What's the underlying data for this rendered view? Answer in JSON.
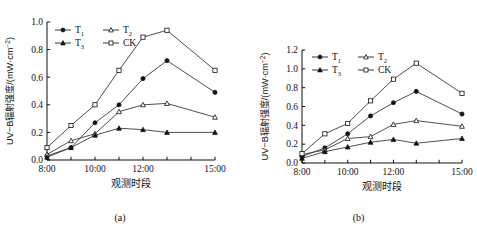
{
  "figure": {
    "panels": [
      {
        "caption": "(a)",
        "axis": {
          "ylabel_main": "UV−B辐射强度/(mW·cm",
          "ylabel_sup": "−2",
          "ylabel_tail": ")",
          "xlabel": "观测时段",
          "yticks": [
            "0.0",
            "0.2",
            "0.4",
            "0.6",
            "0.8",
            "1.0"
          ],
          "xticks": [
            "8:00",
            "10:00",
            "12:00",
            "15:00"
          ]
        },
        "legend": [
          {
            "label": "T",
            "sub": "1",
            "marker": "filled-circle"
          },
          {
            "label": "T",
            "sub": "2",
            "marker": "open-triangle"
          },
          {
            "label": "T",
            "sub": "3",
            "marker": "filled-triangle"
          },
          {
            "label": "CK",
            "sub": "",
            "marker": "open-square"
          }
        ]
      },
      {
        "caption": "(b)",
        "axis": {
          "ylabel_main": "UV−B辐射强度/(mW·cm",
          "ylabel_sup": "−2",
          "ylabel_tail": ")",
          "xlabel": "观测时段",
          "yticks": [
            "0.0",
            "0.2",
            "0.4",
            "0.6",
            "0.8",
            "1.0",
            "1.2"
          ],
          "xticks": [
            "8:00",
            "10:00",
            "12:00",
            "15:00"
          ]
        },
        "legend": [
          {
            "label": "T",
            "sub": "1",
            "marker": "filled-circle"
          },
          {
            "label": "T",
            "sub": "2",
            "marker": "open-triangle"
          },
          {
            "label": "T",
            "sub": "3",
            "marker": "filled-triangle"
          },
          {
            "label": "CK",
            "sub": "",
            "marker": "open-square"
          }
        ]
      }
    ]
  },
  "chart_data": [
    {
      "type": "line",
      "title": "(a)",
      "xlabel": "观测时段",
      "ylabel": "UV−B辐射强度/(mW·cm−2)",
      "x": [
        "8:00",
        "9:00",
        "10:00",
        "11:00",
        "12:00",
        "13:00",
        "15:00"
      ],
      "xtick_labels": [
        "8:00",
        "10:00",
        "12:00",
        "15:00"
      ],
      "xlim": [
        8,
        15
      ],
      "ylim": [
        0.0,
        1.0
      ],
      "ytick_labels": [
        "0.0",
        "0.2",
        "0.4",
        "0.6",
        "0.8",
        "1.0"
      ],
      "grid": false,
      "legend_position": "upper-left",
      "series": [
        {
          "name": "T1",
          "marker": "filled-circle",
          "values": [
            0.03,
            0.09,
            0.27,
            0.4,
            0.59,
            0.72,
            0.49
          ]
        },
        {
          "name": "T2",
          "marker": "open-triangle",
          "values": [
            0.04,
            0.14,
            0.19,
            0.35,
            0.4,
            0.41,
            0.31
          ]
        },
        {
          "name": "T3",
          "marker": "filled-triangle",
          "values": [
            0.02,
            0.09,
            0.18,
            0.23,
            0.22,
            0.2,
            0.2
          ]
        },
        {
          "name": "CK",
          "marker": "open-square",
          "values": [
            0.09,
            0.25,
            0.4,
            0.65,
            0.89,
            0.94,
            0.65
          ]
        }
      ]
    },
    {
      "type": "line",
      "title": "(b)",
      "xlabel": "观测时段",
      "ylabel": "UV−B辐射强度/(mW·cm−2)",
      "x": [
        "8:00",
        "9:00",
        "10:00",
        "11:00",
        "12:00",
        "13:00",
        "15:00"
      ],
      "xtick_labels": [
        "8:00",
        "10:00",
        "12:00",
        "15:00"
      ],
      "xlim": [
        8,
        15
      ],
      "ylim": [
        0.0,
        1.2
      ],
      "ytick_labels": [
        "0.0",
        "0.2",
        "0.4",
        "0.6",
        "0.8",
        "1.0",
        "1.2"
      ],
      "grid": false,
      "legend_position": "upper-left",
      "series": [
        {
          "name": "T1",
          "marker": "filled-circle",
          "values": [
            0.07,
            0.16,
            0.31,
            0.5,
            0.64,
            0.76,
            0.52
          ]
        },
        {
          "name": "T2",
          "marker": "open-triangle",
          "values": [
            0.09,
            0.14,
            0.26,
            0.28,
            0.41,
            0.45,
            0.39
          ]
        },
        {
          "name": "T3",
          "marker": "filled-triangle",
          "values": [
            0.05,
            0.12,
            0.17,
            0.22,
            0.25,
            0.21,
            0.26
          ]
        },
        {
          "name": "CK",
          "marker": "open-square",
          "values": [
            0.1,
            0.31,
            0.42,
            0.66,
            0.89,
            1.06,
            0.74
          ]
        }
      ]
    }
  ]
}
